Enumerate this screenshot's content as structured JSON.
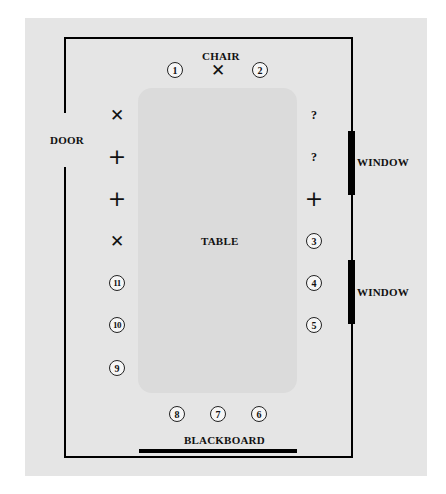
{
  "diagram": {
    "type": "classroom-seating-plan",
    "labels": {
      "chair": "CHAIR",
      "door": "DOOR",
      "table": "TABLE",
      "window_upper": "WINDOW",
      "window_lower": "WINDOW",
      "blackboard": "BLACKBOARD"
    },
    "seats": [
      {
        "id": "top-1",
        "glyph": "1",
        "kind": "number",
        "x": 175,
        "y": 70
      },
      {
        "id": "top-chair",
        "glyph": "✕",
        "kind": "mark",
        "x": 218,
        "y": 70
      },
      {
        "id": "top-2",
        "glyph": "2",
        "kind": "number",
        "x": 260,
        "y": 70
      },
      {
        "id": "left-x1",
        "glyph": "✕",
        "kind": "mark",
        "x": 117,
        "y": 115
      },
      {
        "id": "left-plus1",
        "glyph": "+",
        "kind": "mark",
        "x": 117,
        "y": 157
      },
      {
        "id": "left-plus2",
        "glyph": "+",
        "kind": "mark",
        "x": 117,
        "y": 199
      },
      {
        "id": "left-x2",
        "glyph": "✕",
        "kind": "mark",
        "x": 117,
        "y": 241
      },
      {
        "id": "left-11",
        "glyph": "11",
        "kind": "number",
        "x": 117,
        "y": 283
      },
      {
        "id": "left-10",
        "glyph": "10",
        "kind": "number",
        "x": 117,
        "y": 325
      },
      {
        "id": "left-9",
        "glyph": "9",
        "kind": "number",
        "x": 117,
        "y": 368
      },
      {
        "id": "right-q1",
        "glyph": "?",
        "kind": "question",
        "x": 314,
        "y": 115
      },
      {
        "id": "right-q2",
        "glyph": "?",
        "kind": "question",
        "x": 314,
        "y": 157
      },
      {
        "id": "right-plus",
        "glyph": "+",
        "kind": "mark",
        "x": 314,
        "y": 199
      },
      {
        "id": "right-3",
        "glyph": "3",
        "kind": "number",
        "x": 314,
        "y": 241
      },
      {
        "id": "right-4",
        "glyph": "4",
        "kind": "number",
        "x": 314,
        "y": 283
      },
      {
        "id": "right-5",
        "glyph": "5",
        "kind": "number",
        "x": 314,
        "y": 325
      },
      {
        "id": "bottom-8",
        "glyph": "8",
        "kind": "number",
        "x": 177,
        "y": 414
      },
      {
        "id": "bottom-7",
        "glyph": "7",
        "kind": "number",
        "x": 218,
        "y": 414
      },
      {
        "id": "bottom-6",
        "glyph": "6",
        "kind": "number",
        "x": 259,
        "y": 414
      }
    ],
    "colors": {
      "background": "#ffffff",
      "panel": "#e5e5e5",
      "table": "#dbdbdb",
      "lines": "#000000"
    }
  }
}
